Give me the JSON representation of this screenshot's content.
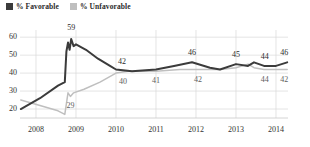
{
  "legend": {
    "position": "top-left",
    "items": [
      {
        "label": "% Favorable",
        "color": "#3b3b3b",
        "swatch": "legend-swatch-favorable"
      },
      {
        "label": "% Unfavorable",
        "color": "#bfbfbf",
        "swatch": "legend-swatch-unfavorable"
      }
    ]
  },
  "chart_data": {
    "type": "line",
    "title": "",
    "subtitle": "",
    "xlabel": "",
    "ylabel": "",
    "grid": true,
    "legend_position": "top-left",
    "ylim": [
      15,
      64
    ],
    "yticks": [
      20,
      30,
      40,
      50,
      60
    ],
    "xlim": [
      2007.6,
      2014.3
    ],
    "xticks": [
      2008,
      2009,
      2010,
      2011,
      2012,
      2013,
      2014
    ],
    "xtick_labels": [
      "2008",
      "2009",
      "2010",
      "2011",
      "2012",
      "2013",
      "2014"
    ],
    "series": [
      {
        "name": "% Favorable",
        "color": "#3b3b3b",
        "points": [
          {
            "x": 2007.62,
            "y": 20
          },
          {
            "x": 2008.1,
            "y": 26
          },
          {
            "x": 2008.55,
            "y": 33
          },
          {
            "x": 2008.72,
            "y": 35
          },
          {
            "x": 2008.76,
            "y": 52
          },
          {
            "x": 2008.8,
            "y": 57
          },
          {
            "x": 2008.84,
            "y": 53
          },
          {
            "x": 2008.88,
            "y": 59
          },
          {
            "x": 2008.94,
            "y": 55
          },
          {
            "x": 2009.0,
            "y": 56
          },
          {
            "x": 2009.25,
            "y": 53
          },
          {
            "x": 2009.55,
            "y": 48
          },
          {
            "x": 2009.85,
            "y": 44
          },
          {
            "x": 2010.0,
            "y": 42
          },
          {
            "x": 2010.4,
            "y": 41
          },
          {
            "x": 2011.0,
            "y": 42
          },
          {
            "x": 2011.45,
            "y": 44
          },
          {
            "x": 2011.9,
            "y": 46
          },
          {
            "x": 2012.35,
            "y": 43
          },
          {
            "x": 2012.6,
            "y": 42
          },
          {
            "x": 2013.0,
            "y": 45
          },
          {
            "x": 2013.3,
            "y": 44
          },
          {
            "x": 2013.45,
            "y": 46
          },
          {
            "x": 2013.7,
            "y": 44
          },
          {
            "x": 2014.0,
            "y": 44
          },
          {
            "x": 2014.28,
            "y": 46
          }
        ]
      },
      {
        "name": "% Unfavorable",
        "color": "#bfbfbf",
        "points": [
          {
            "x": 2007.62,
            "y": 25
          },
          {
            "x": 2008.1,
            "y": 22
          },
          {
            "x": 2008.55,
            "y": 19
          },
          {
            "x": 2008.72,
            "y": 17
          },
          {
            "x": 2008.8,
            "y": 29
          },
          {
            "x": 2008.86,
            "y": 27
          },
          {
            "x": 2008.94,
            "y": 29
          },
          {
            "x": 2009.2,
            "y": 31
          },
          {
            "x": 2009.6,
            "y": 35
          },
          {
            "x": 2010.0,
            "y": 40
          },
          {
            "x": 2010.3,
            "y": 41
          },
          {
            "x": 2011.0,
            "y": 41
          },
          {
            "x": 2011.6,
            "y": 42
          },
          {
            "x": 2012.0,
            "y": 42
          },
          {
            "x": 2012.6,
            "y": 42
          },
          {
            "x": 2013.0,
            "y": 43
          },
          {
            "x": 2013.3,
            "y": 45
          },
          {
            "x": 2013.45,
            "y": 43
          },
          {
            "x": 2013.7,
            "y": 42
          },
          {
            "x": 2014.0,
            "y": 42
          },
          {
            "x": 2014.28,
            "y": 42
          }
        ]
      }
    ],
    "annotations": [
      {
        "text": "59",
        "series": "% Favorable",
        "x": 2008.88,
        "y": 59,
        "dx": 0,
        "dy": -11
      },
      {
        "text": "42",
        "series": "% Favorable",
        "x": 2010.0,
        "y": 42,
        "dx": 6,
        "dy": -8
      },
      {
        "text": "46",
        "series": "% Favorable",
        "x": 2011.9,
        "y": 46,
        "dx": 0,
        "dy": -9
      },
      {
        "text": "45",
        "series": "% Favorable",
        "x": 2013.0,
        "y": 45,
        "dx": 0,
        "dy": -9
      },
      {
        "text": "44",
        "series": "% Favorable",
        "x": 2013.72,
        "y": 44,
        "dx": 0,
        "dy": -9
      },
      {
        "text": "46",
        "series": "% Favorable",
        "x": 2014.28,
        "y": 46,
        "dx": -3,
        "dy": -9
      },
      {
        "text": "29",
        "series": "% Unfavorable",
        "x": 2008.86,
        "y": 27,
        "dx": 0,
        "dy": 10
      },
      {
        "text": "40",
        "series": "% Unfavorable",
        "x": 2010.05,
        "y": 40,
        "dx": 5,
        "dy": 9
      },
      {
        "text": "41",
        "series": "% Unfavorable",
        "x": 2011.0,
        "y": 41,
        "dx": 0,
        "dy": 10
      },
      {
        "text": "42",
        "series": "% Unfavorable",
        "x": 2012.05,
        "y": 42,
        "dx": 0,
        "dy": 10
      },
      {
        "text": "44",
        "series": "% Unfavorable",
        "x": 2013.72,
        "y": 42,
        "dx": 0,
        "dy": 10
      },
      {
        "text": "42",
        "series": "% Unfavorable",
        "x": 2014.28,
        "y": 42,
        "dx": -3,
        "dy": 10
      }
    ]
  },
  "axis": {
    "y_tick_labels": [
      "60",
      "50",
      "40",
      "30",
      "20"
    ],
    "x_tick_labels": [
      "2008",
      "2009",
      "2010",
      "2011",
      "2012",
      "2013",
      "2014"
    ]
  },
  "colors": {
    "favorable": "#3b3b3b",
    "unfavorable": "#bfbfbf",
    "grid": "#d8d8d8",
    "axis": "#c9c9c9",
    "text": "#2b2b2b"
  }
}
